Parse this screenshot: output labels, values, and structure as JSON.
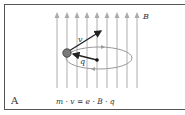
{
  "panel_label": "A",
  "field_label": "B",
  "velocity_label": "v",
  "radius_label": "q",
  "equation": "m · v = e · B · q",
  "colors": {
    "border": "#555555",
    "field_lines": "#b8b8b8",
    "arrows": "#222222",
    "orbit": "#9a9a9a",
    "particle": "#777777"
  }
}
